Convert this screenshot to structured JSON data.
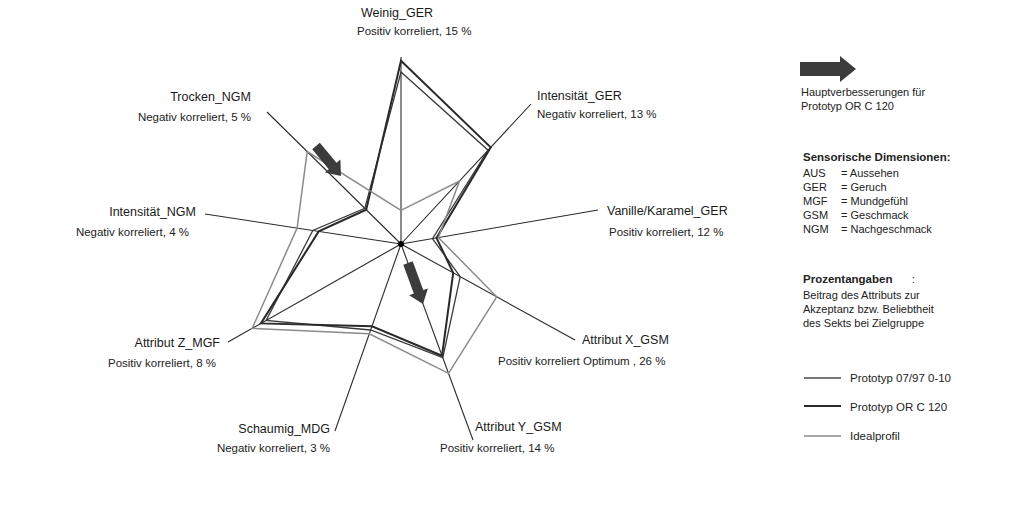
{
  "chart_data": {
    "type": "radar",
    "title": "",
    "center": [
      401,
      244
    ],
    "axes": [
      {
        "name": "Weinig_GER",
        "note": "Positiv korreliert, 15 %",
        "end": [
          401,
          57
        ]
      },
      {
        "name": "Intensität_GER",
        "note": "Negativ korreliert, 13 %",
        "end": [
          531,
          104
        ]
      },
      {
        "name": "Vanille/Karamel_GER",
        "note": "Positiv korreliert, 12 %",
        "end": [
          598,
          210
        ]
      },
      {
        "name": "Attribut X_GSM",
        "note": "Positiv korreliert Optimum , 26 %",
        "end": [
          575,
          340
        ]
      },
      {
        "name": "Attribut Y_GSM",
        "note": "Positiv korreliert, 14 %",
        "end": [
          473,
          440
        ]
      },
      {
        "name": "Schaumig_MDG",
        "note": "Negativ korreliert, 3 %",
        "end": [
          335,
          431
        ]
      },
      {
        "name": "Attribut Z_MGF",
        "note": "Positiv korreliert, 8 %",
        "end": [
          228,
          342
        ]
      },
      {
        "name": "Intensität_NGM",
        "note": "Negativ korreliert, 4 %",
        "end": [
          205,
          214
        ]
      },
      {
        "name": "Trocken_NGM",
        "note": "Negativ korreliert, 5 %",
        "end": [
          267,
          112
        ]
      }
    ],
    "scale": [
      0,
      10
    ],
    "series": [
      {
        "name": "Prototyp 07/97 0-10",
        "color": "#3a3a3a",
        "width": 1.3,
        "values": [
          9.2,
          6.7,
          1.6,
          3.4,
          5.8,
          4.6,
          7.8,
          4.5,
          2.7
        ]
      },
      {
        "name": "Prototyp OR C 120",
        "color": "#2a2a2a",
        "width": 2.0,
        "values": [
          9.8,
          6.9,
          1.8,
          3.0,
          5.7,
          4.4,
          8.1,
          4.2,
          2.6
        ]
      },
      {
        "name": "Idealprofil",
        "color": "#8a8a8a",
        "width": 1.5,
        "values": [
          1.8,
          4.5,
          1.9,
          5.5,
          6.6,
          4.8,
          8.6,
          5.3,
          7.0
        ]
      }
    ],
    "annotations": [
      {
        "type": "arrow",
        "meaning": "Hauptverbesserungen für Prototyp OR C 120",
        "from": [
          316,
          146
        ],
        "to": [
          341,
          176
        ]
      },
      {
        "type": "arrow",
        "meaning": "Hauptverbesserungen für Prototyp OR C 120",
        "from": [
          408,
          263
        ],
        "to": [
          423,
          304
        ]
      }
    ],
    "legend_position": "right"
  },
  "legend": {
    "arrow_text_1": "Hauptverbesserungen für",
    "arrow_text_2": "Prototyp OR C 120",
    "dims_head": "Sensorische Dimensionen:",
    "dims": [
      {
        "k": "AUS",
        "v": "= Aussehen"
      },
      {
        "k": "GER",
        "v": "= Geruch"
      },
      {
        "k": "MGF",
        "v": "= Mundgefühl"
      },
      {
        "k": "GSM",
        "v": "= Geschmack"
      },
      {
        "k": "NGM",
        "v": "= Nachgeschmack"
      }
    ],
    "pct_head": "Prozentangaben",
    "pct_colon": ":",
    "pct_text_1": "Beitrag des Attributs zur",
    "pct_text_2": "Akzeptanz bzw. Beliebtheit",
    "pct_text_3": "des Sekts bei Zielgruppe",
    "series_1": "Prototyp 07/97 0-10",
    "series_2": "Prototyp OR C 120",
    "series_3": "Idealprofil",
    "arrow_color": "#3c3c3c"
  }
}
